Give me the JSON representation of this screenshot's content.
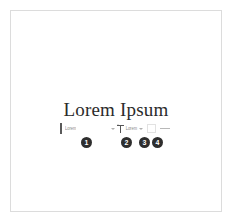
{
  "page": {
    "background_color": "#ffffff",
    "frame_border_color": "#dcdcdc"
  },
  "document": {
    "title": "Lorem Ipsum"
  },
  "toolbar": {
    "caret": {
      "icon": "text-caret-icon"
    },
    "font_family": {
      "label": "font-family-selector",
      "value": "Lorem",
      "dropdown_icon": "chevron-down-icon"
    },
    "font_size": {
      "label": "font-size-selector",
      "icon": "text-size-icon",
      "value": "Lorem",
      "dropdown_icon": "chevron-down-icon"
    },
    "text_color": {
      "label": "text-color-swatch",
      "icon": "color-swatch-icon",
      "color": "#000000"
    },
    "line_style": {
      "label": "line-style-selector",
      "icon": "horizontal-line-icon",
      "color": "#b8b8b8"
    }
  },
  "callouts": {
    "badge_color": "#2e2e2e",
    "badge_text_color": "#ffffff",
    "items": [
      {
        "number": "1",
        "target": "font-family-selector"
      },
      {
        "number": "2",
        "target": "font-size-selector"
      },
      {
        "number": "3",
        "target": "text-color-swatch"
      },
      {
        "number": "4",
        "target": "line-style-selector"
      }
    ]
  }
}
